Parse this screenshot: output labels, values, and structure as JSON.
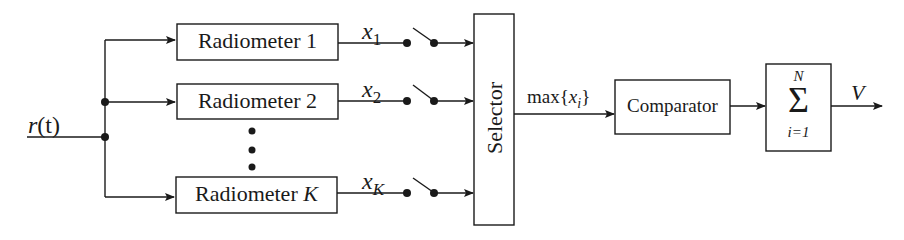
{
  "diagram": {
    "type": "block-diagram",
    "input": {
      "label_base": "r",
      "label_arg": "(t)"
    },
    "radiometers": [
      {
        "label": "Radiometer 1",
        "output_var": "x",
        "output_sub": "1"
      },
      {
        "label": "Radiometer 2",
        "output_var": "x",
        "output_sub": "2"
      },
      {
        "label_text": "Radiometer ",
        "label_italic": "K",
        "output_var": "x",
        "output_sub": "K"
      }
    ],
    "ellipsis": "vertical-dots",
    "selector": {
      "label": "Selector"
    },
    "selector_output": {
      "prefix": "max{",
      "var": "x",
      "sub": "i",
      "suffix": "}"
    },
    "comparator": {
      "label": "Comparator"
    },
    "summation": {
      "symbol": "Σ",
      "upper": "N",
      "lower": "i=1"
    },
    "output": {
      "label": "V"
    },
    "colors": {
      "stroke": "#1a1a1a",
      "background": "#ffffff"
    }
  }
}
